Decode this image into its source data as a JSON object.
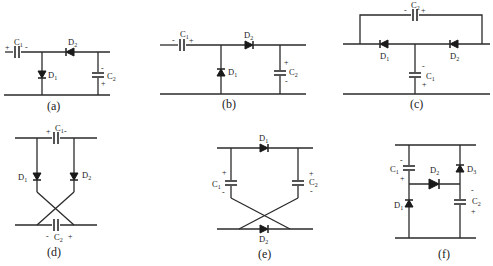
{
  "figure": {
    "subfigures": [
      {
        "id": "a",
        "caption": "(a)",
        "components": [
          {
            "ref": "C1",
            "type": "capacitor",
            "orientation": "horizontal",
            "polarity_left": "+",
            "polarity_right": "-"
          },
          {
            "ref": "D2",
            "type": "diode",
            "direction": "left"
          },
          {
            "ref": "D1",
            "type": "diode",
            "direction": "down"
          },
          {
            "ref": "C2",
            "type": "capacitor",
            "orientation": "vertical",
            "polarity_top": "-",
            "polarity_bottom": "+"
          }
        ]
      },
      {
        "id": "b",
        "caption": "(b)",
        "components": [
          {
            "ref": "C1",
            "type": "capacitor",
            "orientation": "horizontal",
            "polarity_left": "-",
            "polarity_right": "+"
          },
          {
            "ref": "D2",
            "type": "diode",
            "direction": "right"
          },
          {
            "ref": "D1",
            "type": "diode",
            "direction": "up"
          },
          {
            "ref": "C2",
            "type": "capacitor",
            "orientation": "vertical",
            "polarity_top": "+",
            "polarity_bottom": "-"
          }
        ]
      },
      {
        "id": "c",
        "caption": "(c)",
        "components": [
          {
            "ref": "C2",
            "type": "capacitor",
            "orientation": "horizontal",
            "polarity_left": "-",
            "polarity_right": "+"
          },
          {
            "ref": "D1",
            "type": "diode",
            "direction": "left"
          },
          {
            "ref": "D2",
            "type": "diode",
            "direction": "left"
          },
          {
            "ref": "C1",
            "type": "capacitor",
            "orientation": "vertical",
            "polarity_top": "-",
            "polarity_bottom": "+"
          }
        ]
      },
      {
        "id": "d",
        "caption": "(d)",
        "components": [
          {
            "ref": "C1",
            "type": "capacitor",
            "orientation": "horizontal",
            "polarity_left": "+",
            "polarity_right": "-"
          },
          {
            "ref": "D1",
            "type": "diode",
            "direction": "down"
          },
          {
            "ref": "D2",
            "type": "diode",
            "direction": "down"
          },
          {
            "ref": "C2",
            "type": "capacitor",
            "orientation": "horizontal",
            "polarity_left": "-",
            "polarity_right": "+"
          }
        ]
      },
      {
        "id": "e",
        "caption": "(e)",
        "components": [
          {
            "ref": "D1",
            "type": "diode",
            "direction": "right"
          },
          {
            "ref": "C1",
            "type": "capacitor",
            "orientation": "vertical",
            "polarity_top": "+",
            "polarity_bottom": "-"
          },
          {
            "ref": "C2",
            "type": "capacitor",
            "orientation": "vertical",
            "polarity_top": "+",
            "polarity_bottom": "-"
          },
          {
            "ref": "D2",
            "type": "diode",
            "direction": "right"
          }
        ]
      },
      {
        "id": "f",
        "caption": "(f)",
        "components": [
          {
            "ref": "C1",
            "type": "capacitor",
            "orientation": "vertical",
            "polarity_top": "-",
            "polarity_bottom": "+"
          },
          {
            "ref": "D1",
            "type": "diode",
            "direction": "up"
          },
          {
            "ref": "D2",
            "type": "diode",
            "direction": "right"
          },
          {
            "ref": "D3",
            "type": "diode",
            "direction": "up"
          },
          {
            "ref": "C2",
            "type": "capacitor",
            "orientation": "vertical",
            "polarity_top": "-",
            "polarity_bottom": "+"
          }
        ]
      }
    ]
  },
  "labels": {
    "a": {
      "caption": "(a)",
      "C1": "C",
      "C1s": "1",
      "D2": "D",
      "D2s": "2",
      "D1": "D",
      "D1s": "1",
      "C2": "C",
      "C2s": "2",
      "p1": "+",
      "p2": "-",
      "p3": "-",
      "p4": "+"
    },
    "b": {
      "caption": "(b)",
      "C1": "C",
      "C1s": "1",
      "D2": "D",
      "D2s": "2",
      "D1": "D",
      "D1s": "1",
      "C2": "C",
      "C2s": "2",
      "p1": "-",
      "p2": "+",
      "p3": "+",
      "p4": "-"
    },
    "c": {
      "caption": "(c)",
      "C2": "C",
      "C2s": "2",
      "D1": "D",
      "D1s": "1",
      "D2": "D",
      "D2s": "2",
      "C1": "C",
      "C1s": "1",
      "p1": "-",
      "p2": "+",
      "p3": "-",
      "p4": "+"
    },
    "d": {
      "caption": "(d)",
      "C1": "C",
      "C1s": "1",
      "D1": "D",
      "D1s": "1",
      "D2": "D",
      "D2s": "2",
      "C2": "C",
      "C2s": "2",
      "p1": "+",
      "p2": "-",
      "p3": "-",
      "p4": "+"
    },
    "e": {
      "caption": "(e)",
      "D1": "D",
      "D1s": "1",
      "C1": "C",
      "C1s": "1",
      "C2": "C",
      "C2s": "2",
      "D2": "D",
      "D2s": "2",
      "p1": "+",
      "p2": "-",
      "p3": "+",
      "p4": "-"
    },
    "f": {
      "caption": "(f)",
      "C1": "C",
      "C1s": "1",
      "D1": "D",
      "D1s": "1",
      "D2": "D",
      "D2s": "2",
      "D3": "D",
      "D3s": "3",
      "C2": "C",
      "C2s": "2",
      "p1": "-",
      "p2": "+",
      "p3": "-",
      "p4": "+"
    }
  }
}
